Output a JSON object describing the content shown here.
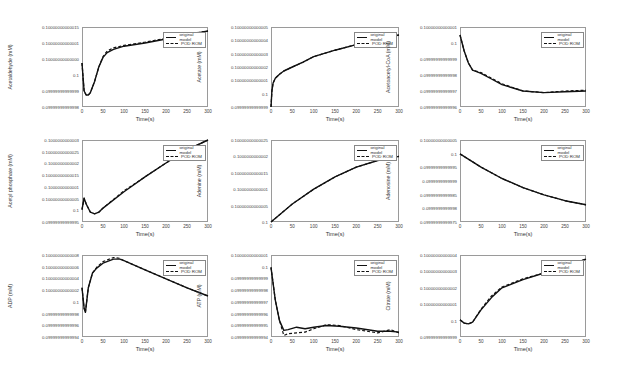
{
  "legend": {
    "original": "original model",
    "rom": "POD ROM"
  },
  "xlabel": "Time(s)",
  "x_ticks": [
    "0",
    "50",
    "100",
    "150",
    "200",
    "250",
    "300"
  ],
  "chart_data": [
    {
      "type": "line",
      "title": "",
      "xlabel": "Time(s)",
      "ylabel": "Acetaldehyde (mM)",
      "xlim": [
        0,
        300
      ],
      "y_ticks": [
        "0.09999999999998",
        "0.09999999999999",
        "0.1",
        "0.10000000000000",
        "0.10000000000001",
        "0.10000000000015"
      ],
      "series": [
        {
          "name": "original model",
          "x": [
            0,
            5,
            10,
            15,
            20,
            30,
            40,
            50,
            60,
            75,
            100,
            150,
            200,
            250,
            300
          ],
          "y": [
            0.55,
            0.2,
            0.15,
            0.15,
            0.18,
            0.32,
            0.5,
            0.62,
            0.68,
            0.72,
            0.76,
            0.8,
            0.85,
            0.9,
            0.95
          ]
        },
        {
          "name": "POD ROM",
          "x": [
            0,
            5,
            10,
            15,
            20,
            30,
            40,
            50,
            60,
            75,
            100,
            150,
            200,
            250,
            300
          ],
          "y": [
            0.55,
            0.2,
            0.15,
            0.15,
            0.18,
            0.32,
            0.5,
            0.63,
            0.7,
            0.74,
            0.77,
            0.81,
            0.86,
            0.91,
            0.95
          ]
        }
      ]
    },
    {
      "type": "line",
      "title": "",
      "xlabel": "Time(s)",
      "ylabel": "Acetate (mM)",
      "xlim": [
        0,
        300
      ],
      "y_ticks": [
        "0.09999999999999",
        "0.1",
        "0.10000000000001",
        "0.10000000000002",
        "0.10000000000003",
        "0.10000000000004",
        "0.10000000000005"
      ],
      "series": [
        {
          "name": "original model",
          "x": [
            0,
            2,
            5,
            10,
            20,
            30,
            50,
            75,
            100,
            150,
            200,
            250,
            300
          ],
          "y": [
            0.0,
            0.2,
            0.3,
            0.36,
            0.41,
            0.45,
            0.5,
            0.56,
            0.63,
            0.71,
            0.78,
            0.85,
            0.9
          ]
        },
        {
          "name": "POD ROM",
          "x": [
            0,
            2,
            5,
            10,
            20,
            30,
            50,
            75,
            100,
            150,
            200,
            250,
            300
          ],
          "y": [
            0.0,
            0.2,
            0.3,
            0.36,
            0.41,
            0.45,
            0.5,
            0.56,
            0.63,
            0.71,
            0.78,
            0.85,
            0.9
          ]
        }
      ]
    },
    {
      "type": "line",
      "title": "",
      "xlabel": "Time(s)",
      "ylabel": "Acetoacetyl-CoA (mM)",
      "xlim": [
        0,
        300
      ],
      "y_ticks": [
        "0.09999999999996",
        "0.09999999999997",
        "0.09999999999998",
        "0.09999999999999",
        "0.1",
        "0.10000000000001"
      ],
      "series": [
        {
          "name": "original model",
          "x": [
            0,
            10,
            20,
            30,
            50,
            75,
            100,
            150,
            200,
            250,
            300
          ],
          "y": [
            0.9,
            0.7,
            0.55,
            0.46,
            0.42,
            0.35,
            0.28,
            0.2,
            0.18,
            0.19,
            0.2
          ]
        },
        {
          "name": "POD ROM",
          "x": [
            0,
            10,
            20,
            30,
            50,
            75,
            100,
            150,
            200,
            250,
            300
          ],
          "y": [
            0.9,
            0.7,
            0.55,
            0.46,
            0.43,
            0.36,
            0.29,
            0.2,
            0.18,
            0.2,
            0.21
          ]
        }
      ]
    },
    {
      "type": "line",
      "title": "",
      "xlabel": "Time(s)",
      "ylabel": "Acetyl phosphate (mM)",
      "xlim": [
        0,
        300
      ],
      "y_ticks": [
        "0.09999999999995",
        "0.1",
        "0.10000000000005",
        "0.1000000000001",
        "0.10000000000015",
        "0.1000000000002",
        "0.10000000000025",
        "0.1000000000003"
      ],
      "series": [
        {
          "name": "original model",
          "x": [
            0,
            5,
            10,
            20,
            30,
            40,
            50,
            100,
            150,
            200,
            250,
            300
          ],
          "y": [
            0.15,
            0.29,
            0.22,
            0.12,
            0.1,
            0.12,
            0.17,
            0.37,
            0.55,
            0.72,
            0.88,
            1.0
          ]
        },
        {
          "name": "POD ROM",
          "x": [
            0,
            5,
            10,
            20,
            30,
            40,
            50,
            100,
            150,
            200,
            250,
            300
          ],
          "y": [
            0.15,
            0.29,
            0.22,
            0.12,
            0.1,
            0.12,
            0.17,
            0.38,
            0.55,
            0.72,
            0.88,
            1.0
          ]
        }
      ]
    },
    {
      "type": "line",
      "title": "",
      "xlabel": "Time(s)",
      "ylabel": "Adenine (mM)",
      "xlim": [
        0,
        300
      ],
      "y_ticks": [
        "0.1",
        "0.10000000000005",
        "0.1000000000001",
        "0.10000000000015",
        "0.1000000000002",
        "0.10000000000025"
      ],
      "series": [
        {
          "name": "original model",
          "x": [
            0,
            50,
            100,
            150,
            200,
            250,
            300
          ],
          "y": [
            0.0,
            0.22,
            0.4,
            0.55,
            0.67,
            0.75,
            0.8
          ]
        },
        {
          "name": "POD ROM",
          "x": [
            0,
            50,
            100,
            150,
            200,
            250,
            300
          ],
          "y": [
            0.0,
            0.22,
            0.4,
            0.55,
            0.67,
            0.75,
            0.8
          ]
        }
      ]
    },
    {
      "type": "line",
      "title": "",
      "xlabel": "Time(s)",
      "ylabel": "Adenosine (mM)",
      "xlim": [
        0,
        300
      ],
      "y_ticks": [
        "0.09999999999975",
        "0.0999999999998",
        "0.09999999999985",
        "0.0999999999999",
        "0.09999999999995",
        "0.1",
        "0.10000000000005"
      ],
      "series": [
        {
          "name": "original model",
          "x": [
            0,
            50,
            100,
            150,
            200,
            250,
            300
          ],
          "y": [
            0.83,
            0.67,
            0.53,
            0.42,
            0.33,
            0.26,
            0.21
          ]
        },
        {
          "name": "POD ROM",
          "x": [
            0,
            50,
            100,
            150,
            200,
            250,
            300
          ],
          "y": [
            0.83,
            0.67,
            0.53,
            0.42,
            0.33,
            0.26,
            0.21
          ]
        }
      ]
    },
    {
      "type": "line",
      "title": "",
      "xlabel": "Time(s)",
      "ylabel": "ADP (mM)",
      "xlim": [
        0,
        300
      ],
      "y_ticks": [
        "0.09999999999994",
        "0.09999999999996",
        "0.09999999999998",
        "0.1",
        "0.10000000000002",
        "0.10000000000004",
        "0.10000000000006",
        "0.10000000000008"
      ],
      "series": [
        {
          "name": "original model",
          "x": [
            0,
            5,
            8,
            15,
            25,
            35,
            50,
            75,
            90,
            100,
            150,
            200,
            250,
            300
          ],
          "y": [
            0.6,
            0.35,
            0.3,
            0.6,
            0.78,
            0.84,
            0.9,
            0.95,
            0.95,
            0.93,
            0.82,
            0.71,
            0.6,
            0.5
          ]
        },
        {
          "name": "POD ROM",
          "x": [
            0,
            5,
            8,
            15,
            25,
            35,
            50,
            75,
            90,
            100,
            150,
            200,
            250,
            300
          ],
          "y": [
            0.6,
            0.35,
            0.3,
            0.6,
            0.78,
            0.85,
            0.92,
            0.97,
            0.96,
            0.93,
            0.82,
            0.71,
            0.6,
            0.5
          ]
        }
      ]
    },
    {
      "type": "line",
      "title": "",
      "xlabel": "Time(s)",
      "ylabel": "ATP (mM)",
      "xlim": [
        0,
        300
      ],
      "y_ticks": [
        "0.09999999999994",
        "0.09999999999995",
        "0.09999999999996",
        "0.09999999999997",
        "0.09999999999998",
        "0.09999999999999",
        "0.1",
        "0.10000000000001"
      ],
      "series": [
        {
          "name": "original model",
          "x": [
            0,
            10,
            20,
            30,
            40,
            60,
            80,
            100,
            130,
            160,
            200,
            250,
            280,
            300
          ],
          "y": [
            0.85,
            0.45,
            0.2,
            0.08,
            0.09,
            0.12,
            0.1,
            0.12,
            0.14,
            0.13,
            0.11,
            0.07,
            0.07,
            0.06
          ]
        },
        {
          "name": "POD ROM",
          "x": [
            0,
            10,
            20,
            30,
            40,
            60,
            80,
            100,
            130,
            160,
            200,
            250,
            280,
            300
          ],
          "y": [
            0.85,
            0.45,
            0.2,
            0.02,
            0.04,
            0.05,
            0.06,
            0.1,
            0.15,
            0.14,
            0.09,
            0.05,
            0.09,
            0.05
          ]
        }
      ]
    },
    {
      "type": "line",
      "title": "",
      "xlabel": "Time(s)",
      "ylabel": "Citrate (mM)",
      "xlim": [
        0,
        300
      ],
      "y_ticks": [
        "0.09999999999999",
        "0.1",
        "0.10000000000001",
        "0.10000000000002",
        "0.10000000000003",
        "0.10000000000004"
      ],
      "series": [
        {
          "name": "original model",
          "x": [
            0,
            10,
            20,
            30,
            50,
            75,
            100,
            150,
            200,
            250,
            300
          ],
          "y": [
            0.21,
            0.17,
            0.16,
            0.18,
            0.33,
            0.48,
            0.6,
            0.7,
            0.78,
            0.86,
            0.95
          ]
        },
        {
          "name": "POD ROM",
          "x": [
            0,
            10,
            20,
            30,
            50,
            75,
            100,
            150,
            200,
            250,
            300
          ],
          "y": [
            0.21,
            0.17,
            0.16,
            0.18,
            0.34,
            0.5,
            0.61,
            0.71,
            0.78,
            0.86,
            0.95
          ]
        }
      ]
    }
  ]
}
